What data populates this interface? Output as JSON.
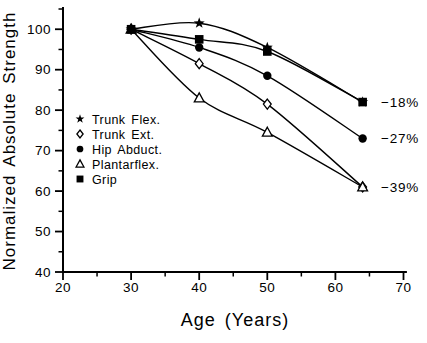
{
  "figure": {
    "background": "#ffffff",
    "ink_color": "#000000"
  },
  "chart_data": {
    "type": "line",
    "title": "",
    "xlabel": "Age (Years)",
    "ylabel": "Normalized Absolute Strength",
    "grid": false,
    "legend_position": "inside-left",
    "xlim": [
      20,
      70.5
    ],
    "ylim": [
      40,
      105.5
    ],
    "x_ticks_major": [
      20,
      30,
      40,
      50,
      60,
      70
    ],
    "x_ticks_minor": [
      25,
      35,
      45,
      55,
      65
    ],
    "y_ticks_major": [
      40,
      50,
      60,
      70,
      80,
      90,
      100
    ],
    "y_ticks_minor": [
      45,
      55,
      65,
      75,
      85,
      95,
      105
    ],
    "x": [
      30,
      40,
      50,
      64
    ],
    "series": [
      {
        "name": "Trunk Flex.",
        "marker": "star",
        "filled": true,
        "values": [
          100,
          101.5,
          95.5,
          82
        ]
      },
      {
        "name": "Trunk Ext.",
        "marker": "diamond",
        "filled": false,
        "values": [
          100,
          91.5,
          81.5,
          61
        ]
      },
      {
        "name": "Hip Abduct.",
        "marker": "circle",
        "filled": true,
        "values": [
          100,
          95.5,
          88.5,
          73
        ]
      },
      {
        "name": "Plantarflex.",
        "marker": "triangle",
        "filled": false,
        "values": [
          100,
          83,
          74.5,
          61
        ]
      },
      {
        "name": "Grip",
        "marker": "square",
        "filled": true,
        "values": [
          100,
          97.5,
          94.5,
          82
        ]
      }
    ],
    "annotations": [
      {
        "text": "−18%",
        "at_value": 82
      },
      {
        "text": "−27%",
        "at_value": 73
      },
      {
        "text": "−39%",
        "at_value": 61
      }
    ]
  }
}
